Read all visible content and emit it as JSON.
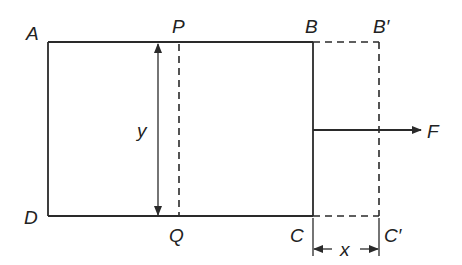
{
  "figure": {
    "labels": {
      "A": "A",
      "B": "B",
      "B_prime": "B′",
      "C": "C",
      "C_prime": "C′",
      "D": "D",
      "P": "P",
      "Q": "Q",
      "y": "y",
      "x": "x",
      "F": "F"
    },
    "colors": {
      "line": "#2a2a2a",
      "background": "#ffffff"
    }
  }
}
